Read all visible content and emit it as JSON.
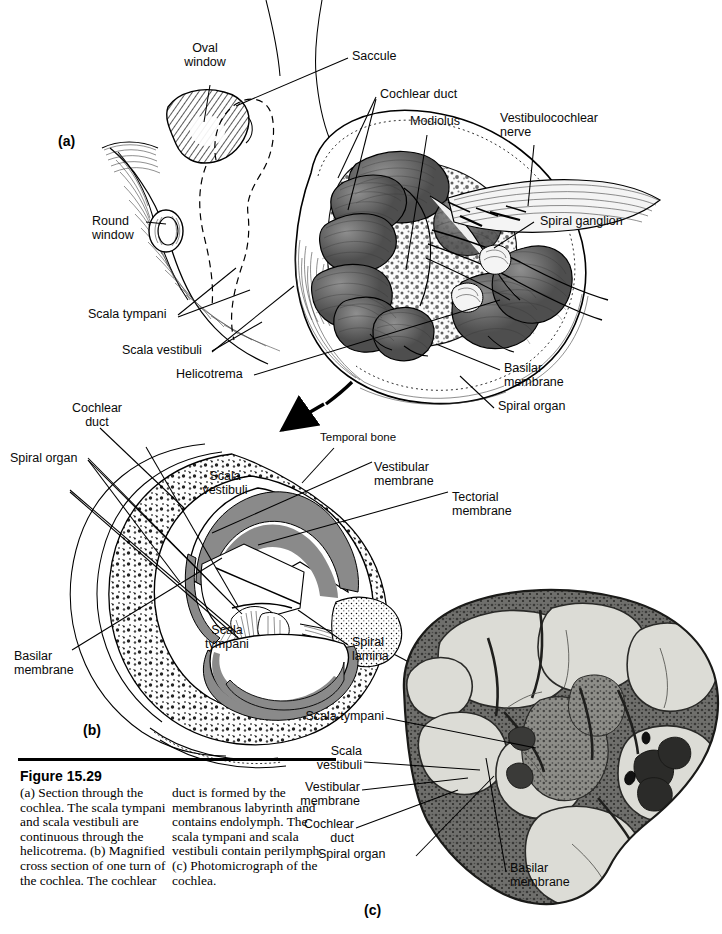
{
  "figure": {
    "number": "Figure 15.29",
    "caption_col1": "(a) Section through the cochlea. The scala tympani and scala vestibuli are continuous through the helicotrema. (b) Magnified cross section of one turn of the cochlea. The cochlear",
    "caption_col2": "duct is formed by the membranous labyrinth and contains endolymph. The scala tympani and scala vestibuli contain perilymph. (c) Photomicrograph of the cochlea."
  },
  "panels": {
    "a": "(a)",
    "b": "(b)",
    "c": "(c)"
  },
  "panel_a_labels": {
    "oval_window": "Oval\nwindow",
    "saccule": "Saccule",
    "cochlear_duct": "Cochlear duct",
    "modiolus": "Modiolus",
    "vestibulocochlear_nerve": "Vestibulocochlear\nnerve",
    "spiral_ganglion": "Spiral ganglion",
    "round_window": "Round\nwindow",
    "scala_tympani": "Scala tympani",
    "scala_vestibuli": "Scala vestibuli",
    "helicotrema": "Helicotrema",
    "basilar_membrane": "Basilar\nmembrane",
    "spiral_organ": "Spiral organ"
  },
  "panel_b_labels": {
    "cochlear_duct": "Cochlear\nduct",
    "spiral_organ": "Spiral organ",
    "temporal_bone": "Temporal bone",
    "scala_vestibuli": "Scala\nvestibuli",
    "vestibular_membrane": "Vestibular\nmembrane",
    "tectorial_membrane": "Tectorial\nmembrane",
    "scala_tympani": "Scala\ntympani",
    "spiral_lamina": "Spiral\nlamina",
    "basilar_membrane": "Basilar\nmembrane"
  },
  "panel_c_labels": {
    "scala_tympani": "Scala tympani",
    "scala_vestibuli": "Scala\nvestibuli",
    "vestibular_membrane": "Vestibular\nmembrane",
    "cochlear_duct": "Cochlear\nduct",
    "spiral_organ": "Spiral organ",
    "basilar_membrane": "Basilar\nmembrane"
  },
  "colors": {
    "ink": "#000000",
    "perilymph_gray": "#8a8a8a",
    "duct_dark": "#6d6d6d",
    "bone_light": "#f2f2f2",
    "micrograph_tissue": "#d8d8d4",
    "micrograph_dark": "#4a4a48"
  }
}
